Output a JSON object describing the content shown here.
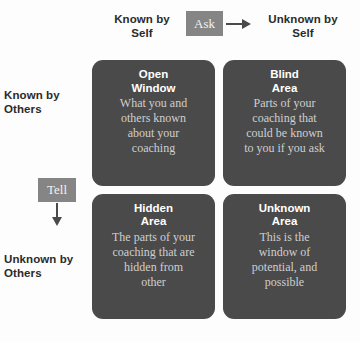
{
  "axes": {
    "top_left": "Known by\nSelf",
    "top_right": "Unknown by\nSelf",
    "left_top": "Known by\nOthers",
    "left_bottom": "Unknown by\nOthers"
  },
  "actions": {
    "ask": "Ask",
    "tell": "Tell"
  },
  "quadrants": [
    {
      "title": "Open\nWindow",
      "body": "What you and\nothers known\nabout your\ncoaching"
    },
    {
      "title": "Blind\nArea",
      "body": "Parts of your\ncoaching that\ncould be known\nto you if you ask"
    },
    {
      "title": "Hidden\nArea",
      "body": "The parts of your\ncoaching that are\nhidden from\nother"
    },
    {
      "title": "Unknown\nArea",
      "body": "This is the\nwindow of\npotential, and\npossible"
    }
  ],
  "colors": {
    "quadrant_fill": "#4a4a4a",
    "chip_fill": "#858585",
    "title_text": "#ffffff",
    "body_text": "#cfcfcf",
    "axis_text": "#2b2b2b",
    "background": "#fdfdfd"
  }
}
